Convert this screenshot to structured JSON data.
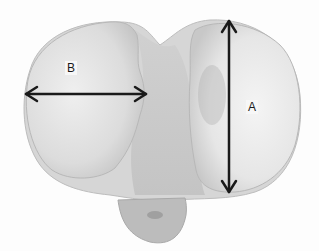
{
  "figure": {
    "labels": {
      "a": "A",
      "b": "B"
    },
    "measurements": [
      {
        "label": "A",
        "orientation": "vertical",
        "x": 229,
        "y1": 20,
        "y2": 193
      },
      {
        "label": "B",
        "orientation": "horizontal",
        "y": 94,
        "x1": 25,
        "x2": 146
      }
    ],
    "colors": {
      "bone_light": "#e8e8e8",
      "bone_mid": "#cfcfcf",
      "bone_dark": "#a8a8a8",
      "arrow": "#1a1a1a"
    }
  }
}
